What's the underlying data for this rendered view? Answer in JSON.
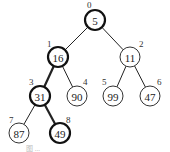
{
  "diagram": {
    "type": "binary-heap-tree",
    "nodes": [
      {
        "index": "0",
        "value": "5",
        "x": 95,
        "y": 20,
        "bold": true,
        "ix": 87,
        "iy": 8
      },
      {
        "index": "1",
        "value": "16",
        "x": 58,
        "y": 57,
        "bold": true,
        "ix": 47,
        "iy": 47
      },
      {
        "index": "2",
        "value": "11",
        "x": 130,
        "y": 57,
        "bold": false,
        "ix": 139,
        "iy": 47
      },
      {
        "index": "3",
        "value": "31",
        "x": 40,
        "y": 96,
        "bold": true,
        "ix": 29,
        "iy": 85
      },
      {
        "index": "4",
        "value": "90",
        "x": 77,
        "y": 96,
        "bold": false,
        "ix": 83,
        "iy": 85
      },
      {
        "index": "5",
        "value": "99",
        "x": 113,
        "y": 96,
        "bold": false,
        "ix": 102,
        "iy": 85
      },
      {
        "index": "6",
        "value": "47",
        "x": 150,
        "y": 96,
        "bold": false,
        "ix": 157,
        "iy": 85
      },
      {
        "index": "7",
        "value": "87",
        "x": 19,
        "y": 133,
        "bold": false,
        "ix": 9,
        "iy": 123
      },
      {
        "index": "8",
        "value": "49",
        "x": 60,
        "y": 133,
        "bold": true,
        "ix": 66,
        "iy": 123
      }
    ],
    "edges": [
      {
        "from": "0",
        "to": "1",
        "bold": false
      },
      {
        "from": "0",
        "to": "2",
        "bold": false
      },
      {
        "from": "1",
        "to": "3",
        "bold": true
      },
      {
        "from": "1",
        "to": "4",
        "bold": false
      },
      {
        "from": "2",
        "to": "5",
        "bold": false
      },
      {
        "from": "2",
        "to": "6",
        "bold": false
      },
      {
        "from": "3",
        "to": "7",
        "bold": false
      },
      {
        "from": "3",
        "to": "8",
        "bold": true
      }
    ],
    "highlighted_path": [
      "5",
      "16",
      "31",
      "49"
    ]
  },
  "caption": "图 ..."
}
